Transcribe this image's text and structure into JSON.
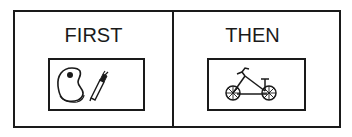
{
  "board": {
    "panels": [
      {
        "label": "FIRST",
        "icons": [
          "paint-palette-icon",
          "paintbrush-icon"
        ]
      },
      {
        "label": "THEN",
        "icons": [
          "bicycle-icon"
        ]
      }
    ]
  },
  "colors": {
    "ink": "#1a1a1a",
    "background": "#ffffff"
  }
}
